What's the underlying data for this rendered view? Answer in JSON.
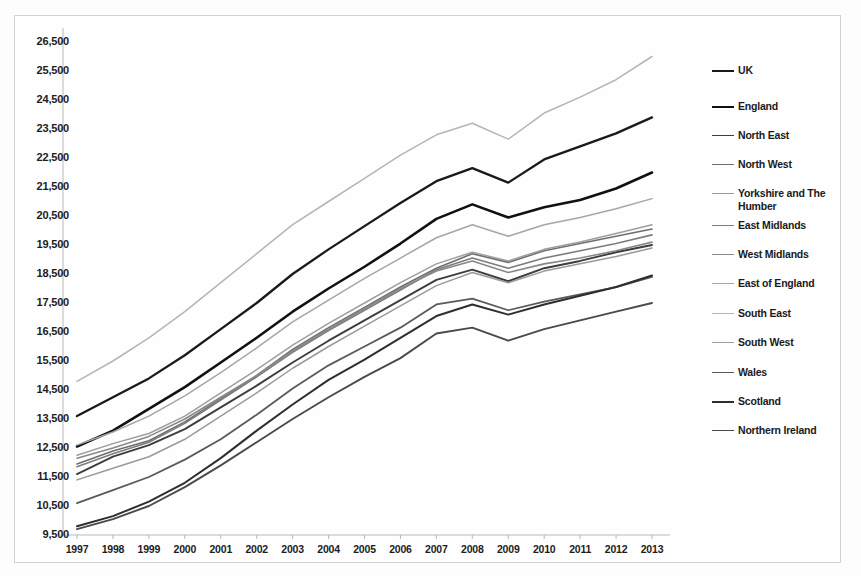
{
  "chart_data": {
    "type": "line",
    "title": "",
    "xlabel": "",
    "ylabel": "",
    "x": [
      1997,
      1998,
      1999,
      2000,
      2001,
      2002,
      2003,
      2004,
      2005,
      2006,
      2007,
      2008,
      2009,
      2010,
      2011,
      2012,
      2013
    ],
    "xtick_labels": [
      "1997",
      "1998",
      "1999",
      "2000",
      "2001",
      "2002",
      "2003",
      "2004",
      "2005",
      "2006",
      "2007",
      "2008",
      "2009",
      "2010",
      "2011",
      "2012",
      "2013"
    ],
    "ytick_labels": [
      "9,500",
      "10,500",
      "11,500",
      "12,500",
      "13,500",
      "14,500",
      "15,500",
      "16,500",
      "17,500",
      "18,500",
      "19,500",
      "20,500",
      "21,500",
      "22,500",
      "23,500",
      "24,500",
      "25,500",
      "26,500"
    ],
    "ytick_values": [
      9500,
      10500,
      11500,
      12500,
      13500,
      14500,
      15500,
      16500,
      17500,
      18500,
      19500,
      20500,
      21500,
      22500,
      23500,
      24500,
      25500,
      26500
    ],
    "ylim": [
      9500,
      26500
    ],
    "xlim": [
      1997,
      2013
    ],
    "grid": false,
    "legend_position": "right",
    "series": [
      {
        "name": "UK",
        "color": "#1a1a1a",
        "width": 2.3,
        "values": [
          13600,
          14250,
          14900,
          15700,
          16600,
          17500,
          18500,
          19350,
          20150,
          20950,
          21700,
          22150,
          21650,
          22450,
          22900,
          23350,
          23900
        ]
      },
      {
        "name": "England",
        "color": "#111111",
        "width": 2.6,
        "values": [
          12550,
          13100,
          13850,
          14600,
          15450,
          16300,
          17200,
          18000,
          18750,
          19550,
          20400,
          20900,
          20450,
          20800,
          21050,
          21450,
          22000
        ]
      },
      {
        "name": "North East",
        "color": "#3d3d3d",
        "width": 1.9,
        "values": [
          11600,
          12200,
          12600,
          13150,
          13900,
          14650,
          15450,
          16200,
          16900,
          17600,
          18300,
          18650,
          18250,
          18700,
          18950,
          19250,
          19500
        ]
      },
      {
        "name": "North West",
        "color": "#6e6e6e",
        "width": 1.6,
        "values": [
          11950,
          12400,
          12750,
          13400,
          14200,
          15000,
          15900,
          16650,
          17350,
          18050,
          18700,
          19200,
          18900,
          19300,
          19550,
          19800,
          20050
        ]
      },
      {
        "name": "Yorkshire and The Humber",
        "color": "#9a9a9a",
        "width": 1.5,
        "values": [
          11400,
          11800,
          12200,
          12800,
          13600,
          14400,
          15250,
          16000,
          16700,
          17400,
          18100,
          18550,
          18200,
          18600,
          18850,
          19100,
          19400
        ]
      },
      {
        "name": "East Midlands",
        "color": "#7d7d7d",
        "width": 1.6,
        "values": [
          11850,
          12300,
          12700,
          13350,
          14150,
          14950,
          15800,
          16550,
          17250,
          17950,
          18650,
          19050,
          18700,
          19050,
          19300,
          19550,
          19850
        ]
      },
      {
        "name": "West Midlands",
        "color": "#888888",
        "width": 1.6,
        "values": [
          12150,
          12500,
          12900,
          13500,
          14250,
          15000,
          15850,
          16600,
          17300,
          18000,
          18600,
          18950,
          18550,
          18850,
          19050,
          19300,
          19600
        ]
      },
      {
        "name": "East of England",
        "color": "#a6a6a6",
        "width": 1.5,
        "values": [
          12600,
          13050,
          13600,
          14300,
          15100,
          15950,
          16850,
          17600,
          18350,
          19050,
          19750,
          20200,
          19800,
          20200,
          20450,
          20750,
          21100
        ]
      },
      {
        "name": "South East",
        "color": "#b5b5b5",
        "width": 1.5,
        "values": [
          14800,
          15500,
          16300,
          17200,
          18200,
          19200,
          20200,
          21000,
          21800,
          22600,
          23300,
          23700,
          23150,
          24050,
          24600,
          25200,
          26000
        ]
      },
      {
        "name": "South West",
        "color": "#9e9e9e",
        "width": 1.5,
        "values": [
          12250,
          12650,
          13000,
          13600,
          14400,
          15200,
          16050,
          16800,
          17500,
          18200,
          18850,
          19250,
          18950,
          19350,
          19600,
          19900,
          20200
        ]
      },
      {
        "name": "Wales",
        "color": "#5a5a5a",
        "width": 1.8,
        "values": [
          10600,
          11050,
          11500,
          12100,
          12800,
          13650,
          14550,
          15350,
          16000,
          16650,
          17450,
          17650,
          17250,
          17550,
          17800,
          18050,
          18400
        ]
      },
      {
        "name": "Scotland",
        "color": "#2e2e2e",
        "width": 2.0,
        "values": [
          9800,
          10150,
          10650,
          11300,
          12150,
          13100,
          14000,
          14850,
          15550,
          16300,
          17050,
          17450,
          17100,
          17450,
          17750,
          18050,
          18450
        ]
      },
      {
        "name": "Northern Ireland",
        "color": "#4a4a4a",
        "width": 1.9,
        "values": [
          9700,
          10050,
          10500,
          11150,
          11900,
          12700,
          13500,
          14250,
          14950,
          15600,
          16450,
          16650,
          16200,
          16600,
          16900,
          17200,
          17500
        ]
      }
    ]
  },
  "legend": {
    "items": [
      {
        "label": "UK"
      },
      {
        "label": "England"
      },
      {
        "label": "North East"
      },
      {
        "label": "North West"
      },
      {
        "label": "Yorkshire and The Humber"
      },
      {
        "label": "East Midlands"
      },
      {
        "label": "West Midlands"
      },
      {
        "label": "East of England"
      },
      {
        "label": "South East"
      },
      {
        "label": "South West"
      },
      {
        "label": "Wales"
      },
      {
        "label": "Scotland"
      },
      {
        "label": "Northern Ireland"
      }
    ]
  }
}
